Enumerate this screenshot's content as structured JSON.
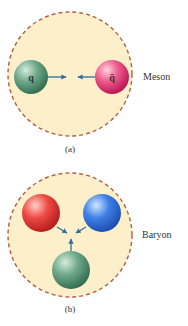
{
  "panels": [
    {
      "id": "a",
      "caption": "(a)",
      "label": "Meson",
      "particles": [
        {
          "symbol": "q",
          "color": "green"
        },
        {
          "symbol": "q̄",
          "color": "pink"
        }
      ]
    },
    {
      "id": "b",
      "caption": "(b)",
      "label": "Baryon",
      "particles": [
        {
          "symbol": "",
          "color": "red"
        },
        {
          "symbol": "",
          "color": "blue"
        },
        {
          "symbol": "",
          "color": "green"
        }
      ]
    }
  ],
  "colors": {
    "boundary_fill": "#fcefc9",
    "boundary_stroke": "#b5603f",
    "arrow": "#2f6e9e",
    "green": "#4e8f6e",
    "pink": "#e8407a",
    "red": "#e0383a",
    "blue": "#2f6fd6"
  }
}
